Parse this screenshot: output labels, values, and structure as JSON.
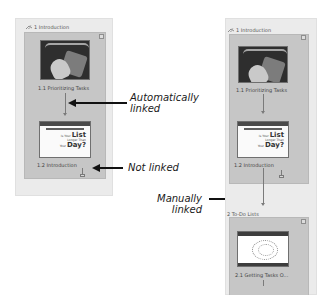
{
  "left_panel": {
    "section_title": "1 Introduction",
    "items": [
      {
        "caption": "1.1 Prioritizing Tasks",
        "thumbnail": "photo-hand-calendar"
      },
      {
        "caption": "1.2 Introduction",
        "thumbnail": "slide",
        "slide_text": {
          "line1_small": "Is Your",
          "line1_big": "List",
          "line2": "Longer Than",
          "line3_small": "Your",
          "line3_big": "Day?"
        }
      }
    ],
    "link_1_to_2": "automatic",
    "link_after_2": "none"
  },
  "right_panel": {
    "section_title": "1 Introduction",
    "items": [
      {
        "caption": "1.1 Prioritizing Tasks",
        "thumbnail": "photo-hand-calendar"
      },
      {
        "caption": "1.2 Introduction",
        "thumbnail": "slide",
        "slide_text": {
          "line1_small": "Is Your",
          "line1_big": "List",
          "line2": "Longer Than",
          "line3_small": "Your",
          "line3_big": "Day?"
        }
      }
    ],
    "second_section_title": "2 To-Do Lists",
    "second_items": [
      {
        "caption": "2.1 Getting Tasks O...",
        "thumbnail": "mind-map"
      }
    ]
  },
  "annotations": {
    "auto": {
      "line1": "Automatically",
      "line2": "linked"
    },
    "not": {
      "line1": "Not linked"
    },
    "manual": {
      "line1": "Manually",
      "line2": "linked"
    }
  },
  "colors": {
    "outer_bg": "#ebebeb",
    "inner_bg": "#c6c6c6",
    "connector": "#7a7a7a",
    "annotation": "#111111"
  }
}
